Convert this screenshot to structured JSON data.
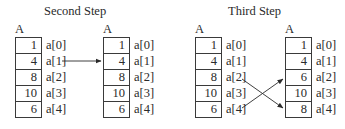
{
  "panels": [
    {
      "title": "Second Step",
      "arrays": [
        {
          "label": "A",
          "values": [
            "1",
            "4",
            "8",
            "10",
            "6"
          ],
          "indices": [
            "a[0]",
            "a[1]",
            "a[2]",
            "a[3]",
            "a[4]"
          ]
        },
        {
          "label": "A",
          "values": [
            "1",
            "4",
            "8",
            "10",
            "6"
          ],
          "indices": [
            "a[0]",
            "a[1]",
            "a[2]",
            "a[3]",
            "a[4]"
          ]
        }
      ],
      "arrows": [
        {
          "from": "a[1]",
          "to": "a[1]"
        }
      ]
    },
    {
      "title": "Third Step",
      "arrays": [
        {
          "label": "A",
          "values": [
            "1",
            "4",
            "8",
            "10",
            "6"
          ],
          "indices": [
            "a[0]",
            "a[1]",
            "a[2]",
            "a[3]",
            "a[4]"
          ]
        },
        {
          "label": "A",
          "values": [
            "1",
            "4",
            "6",
            "10",
            "8"
          ],
          "indices": [
            "a[0]",
            "a[1]",
            "a[2]",
            "a[3]",
            "a[4]"
          ]
        }
      ],
      "arrows": [
        {
          "from": "a[2]",
          "to": "a[4]"
        },
        {
          "from": "a[4]",
          "to": "a[2]"
        }
      ]
    }
  ]
}
